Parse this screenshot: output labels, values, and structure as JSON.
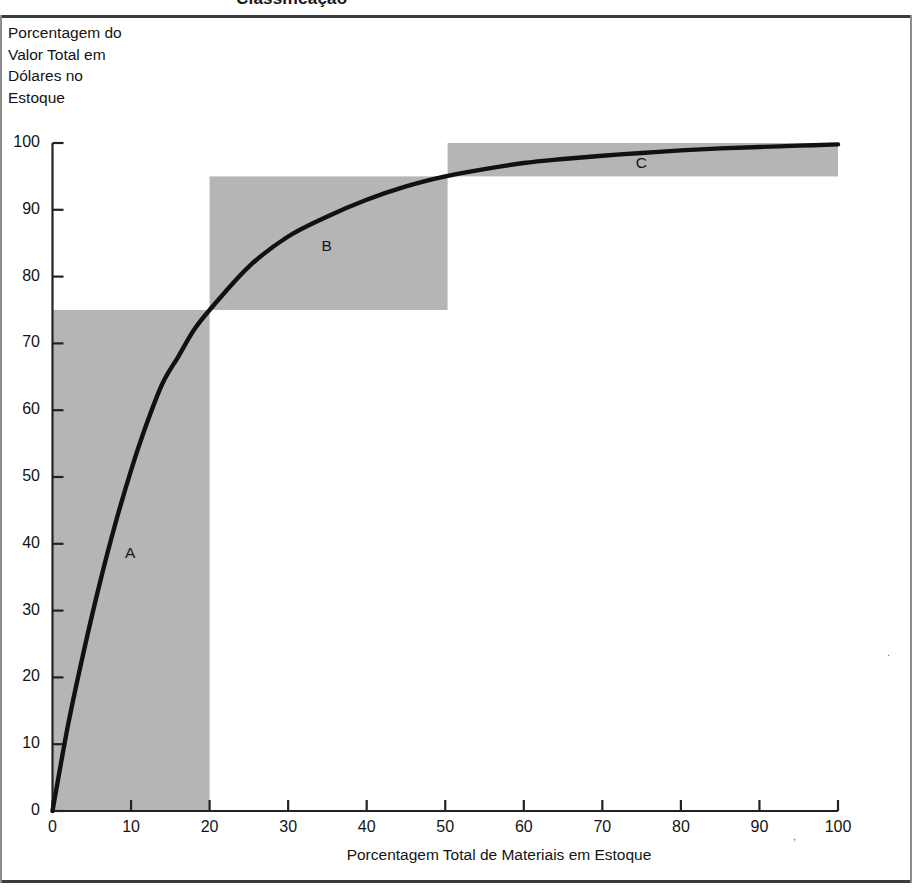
{
  "figure": {
    "caption_partial": "Classificação",
    "y_axis_title": "Porcentagem do\nValor Total em\nDólares no\nEstoque",
    "x_axis_title": "Porcentagem Total de Materiais em Estoque"
  },
  "colors": {
    "band_fill": "#b5b5b5",
    "curve": "#111111",
    "axis": "#222222",
    "rule": "#3a3a3a",
    "text": "#141414"
  },
  "chart_data": {
    "type": "line",
    "title": "",
    "subtitle": "",
    "xlabel": "Porcentagem Total de Materiais em Estoque",
    "ylabel": "Porcentagem do Valor Total em Dólares no Estoque",
    "xlim": [
      0,
      100
    ],
    "ylim": [
      0,
      100
    ],
    "xticks": [
      0,
      10,
      20,
      30,
      40,
      50,
      60,
      70,
      80,
      90,
      100
    ],
    "yticks": [
      0,
      10,
      20,
      30,
      40,
      50,
      60,
      70,
      80,
      90,
      100
    ],
    "grid": false,
    "legend": null,
    "series": [
      {
        "name": "Curva de Pareto ABC",
        "x": [
          0,
          2,
          4,
          6,
          8,
          10,
          12,
          14,
          16,
          18,
          20,
          25,
          30,
          35,
          40,
          45,
          50,
          55,
          60,
          65,
          70,
          75,
          80,
          85,
          90,
          95,
          100
        ],
        "y": [
          0,
          13,
          24,
          34,
          43,
          51,
          58,
          64,
          68,
          72,
          75,
          81.5,
          86,
          89,
          91.5,
          93.5,
          95,
          96.1,
          97,
          97.6,
          98.1,
          98.5,
          98.9,
          99.2,
          99.4,
          99.6,
          99.8
        ]
      }
    ],
    "bands": [
      {
        "label": "A",
        "x_start": 0,
        "x_end": 20,
        "y_start": 0,
        "y_end": 75,
        "label_x": 10,
        "label_y": 38.5,
        "fill": "#b5b5b5"
      },
      {
        "label": "B",
        "x_start": 20,
        "x_end": 50.3,
        "y_start": 75,
        "y_end": 95,
        "label_x": 35,
        "label_y": 84.5,
        "fill": "#b5b5b5"
      },
      {
        "label": "C",
        "x_start": 50.3,
        "x_end": 100,
        "y_start": 95,
        "y_end": 100,
        "label_x": 75,
        "label_y": 96.8,
        "fill": "#b5b5b5"
      }
    ],
    "annotations": [
      {
        "text": "A",
        "x": 10,
        "y": 38.5
      },
      {
        "text": "B",
        "x": 35,
        "y": 84.5
      },
      {
        "text": "C",
        "x": 75,
        "y": 96.8
      }
    ]
  },
  "ticks": {
    "y": [
      "100",
      "90",
      "80",
      "70",
      "60",
      "50",
      "40",
      "30",
      "20",
      "10",
      "0"
    ],
    "x": [
      "0",
      "10",
      "20",
      "30",
      "40",
      "50",
      "60",
      "70",
      "80",
      "90",
      "100"
    ]
  },
  "band_labels": {
    "a": "A",
    "b": "B",
    "c": "C"
  }
}
